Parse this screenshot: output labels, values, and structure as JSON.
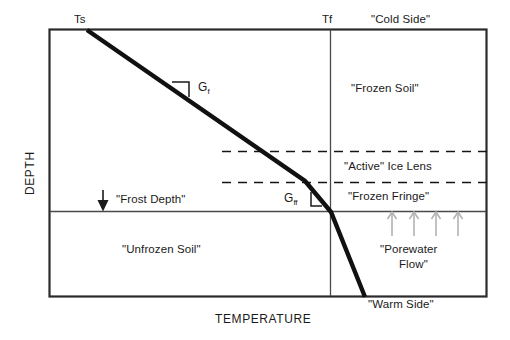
{
  "figure": {
    "axes": {
      "x_label": "TEMPERATURE",
      "y_label": "DEPTH"
    },
    "markers": {
      "surface_temp": "Ts",
      "freezing_temp": "Tf",
      "cold_side": "\"Cold Side\"",
      "warm_side": "\"Warm Side\""
    },
    "zones": [
      {
        "key": "frozen_soil",
        "label": "\"Frozen Soil\""
      },
      {
        "key": "active_ice_lens",
        "label": "\"Active\" Ice Lens"
      },
      {
        "key": "frozen_fringe",
        "label": "\"Frozen Fringe\""
      },
      {
        "key": "unfrozen_soil",
        "label": "\"Unfrozen Soil\""
      }
    ],
    "annotations": {
      "frost_depth": "\"Frost Depth\"",
      "porewater_flow_line1": "\"Porewater",
      "porewater_flow_line2": "Flow\"",
      "gradient_frozen_symbol": "G",
      "gradient_frozen_sub": "f",
      "gradient_fringe_symbol": "G",
      "gradient_fringe_sub": "ff"
    },
    "colors": {
      "ink": "#1a1a1a",
      "profile_line": "#111111",
      "frame": "#333333",
      "thin_line": "#555555",
      "dashed_line": "#111111",
      "arrow_gray": "#b0b0b0",
      "background": "#ffffff"
    }
  }
}
